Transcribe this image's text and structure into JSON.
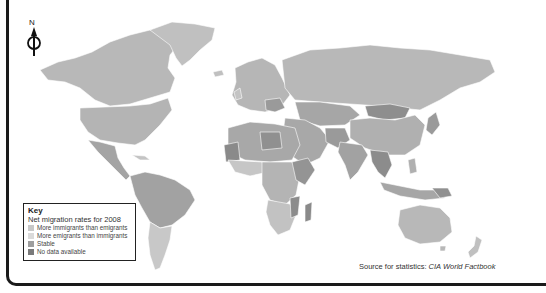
{
  "map": {
    "title_partial": "",
    "compass": {
      "label": "N",
      "icon": "north-arrow-icon"
    },
    "colors": {
      "more_immigrants": "#c8c8c8",
      "more_emigrants": "#d9d9d9",
      "stable": "#a8a8a8",
      "no_data": "#808080",
      "land_default": "#b9b9b9",
      "water": "#ffffff",
      "frame": "#1a1a1a"
    }
  },
  "legend": {
    "title": "Key",
    "subtitle": "Net migration rates for 2008",
    "items": [
      {
        "label": "More immigrants than emigrants",
        "color": "#c8c8c8"
      },
      {
        "label": "More emigrants than immigrants",
        "color": "#dadada"
      },
      {
        "label": "Stable",
        "color": "#9e9e9e"
      },
      {
        "label": "No data available",
        "color": "#7a7a7a"
      }
    ]
  },
  "source": {
    "prefix": "Source for statistics: ",
    "name": "CIA World Factbook"
  }
}
